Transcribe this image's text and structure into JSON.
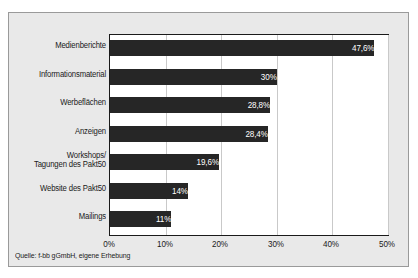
{
  "chart_data": {
    "type": "bar",
    "orientation": "horizontal",
    "title": "",
    "xlabel": "",
    "ylabel": "",
    "categories": [
      "Medienberichte",
      "Informationsmaterial",
      "Werbeflächen",
      "Anzeigen",
      "Workshops/\nTagungen des Pakt50",
      "Website des Pakt50",
      "Mailings"
    ],
    "values": [
      47.6,
      30,
      28.8,
      28.4,
      19.6,
      14,
      11
    ],
    "value_labels": [
      "47,6%",
      "30%",
      "28,8%",
      "28,4%",
      "19,6%",
      "14%",
      "11%"
    ],
    "xlim": [
      0,
      50
    ],
    "xticks": [
      0,
      10,
      20,
      30,
      40,
      50
    ],
    "xtick_labels": [
      "0%",
      "10%",
      "20%",
      "30%",
      "40%",
      "50%"
    ],
    "grid": "vertical",
    "legend": "none",
    "bar_color": "#262626",
    "plot_background": "#ffffff",
    "figure_background": "#e9e9e9",
    "gridline_color": "#c9c9c9",
    "axis_color": "#1a1a1a",
    "value_label_color": "#ffffff"
  },
  "source": {
    "text": "Quelle: f-bb gGmbH, eigene Erhebung"
  }
}
